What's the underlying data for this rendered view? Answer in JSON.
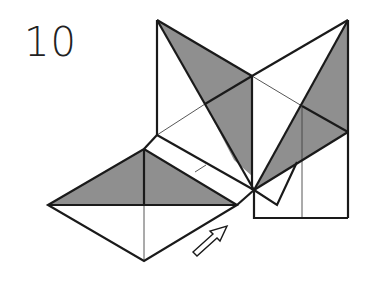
{
  "diagram": {
    "step_number": "10",
    "type": "origami fold instruction",
    "colors": {
      "line": "#1a1a1a",
      "shade": "#8f8f8f",
      "paper": "#ffffff"
    },
    "annotations": [
      {
        "kind": "arrow",
        "direction": "up-right",
        "meaning": "push / move flap"
      }
    ]
  }
}
